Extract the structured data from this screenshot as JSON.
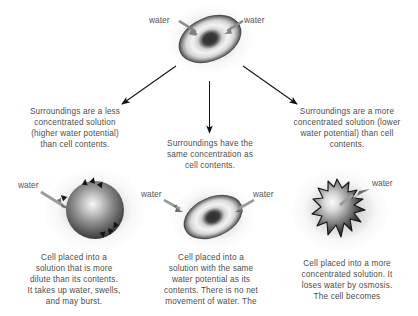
{
  "diagram": {
    "top_cell": {
      "name": "normal-red-blood-cell",
      "water_label_left": "water",
      "water_label_right": "water"
    },
    "branches": [
      {
        "id": "hypotonic",
        "condition_text": "Surroundings are a less concentrated solution (higher water potential) than cell contents.",
        "condition_lines": [
          "Surroundings are a less",
          "concentrated solution",
          "(higher water potential)",
          "than cell contents."
        ],
        "cell_name": "swollen-bursting-cell",
        "water_labels": [
          "water"
        ],
        "result_text": "Cell placed into a solution that is more dilute than its contents. It takes up water, swells, and may burst.",
        "result_lines": [
          "Cell placed into a",
          "solution that is more",
          "dilute than its contents.",
          "It takes up water, swells,",
          "and may burst."
        ]
      },
      {
        "id": "isotonic",
        "condition_text": "Surroundings have the same concentration as cell contents.",
        "condition_lines": [
          "Surroundings have the",
          "same concentration as",
          "cell contents."
        ],
        "cell_name": "normal-red-blood-cell",
        "water_labels": [
          "water",
          "water"
        ],
        "result_text": "Cell placed into a solution with the same water potential as its contents. There is no net movement of water. The",
        "result_lines": [
          "Cell placed into a",
          "solution with the same",
          "water potential as its",
          "contents. There is no net",
          "movement of water. The"
        ]
      },
      {
        "id": "hypertonic",
        "condition_text": "Surroundings are a more concentrated solution (lower water potential) than cell contents.",
        "condition_lines": [
          "Surroundings are a more",
          "concentrated solution (lower",
          "water potential) than cell",
          "contents."
        ],
        "cell_name": "shriveled-crenated-cell",
        "water_labels": [
          "water"
        ],
        "result_text": "Cell placed into a more concentrated solution. It loses water by osmosis. The cell becomes",
        "result_lines": [
          "Cell placed into a more",
          "concentrated solution. It",
          "loses water by osmosis.",
          "The cell becomes"
        ]
      }
    ],
    "colors": {
      "text": "#4d4d4d",
      "arrow": "#111111",
      "background": "#ffffff",
      "cell_dark": "#1a1a1a",
      "cell_light": "#f2f2f2"
    }
  }
}
